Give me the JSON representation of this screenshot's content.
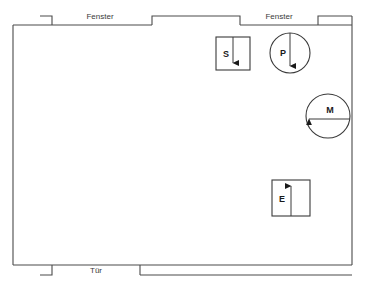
{
  "diagram": {
    "type": "floor-plan",
    "stroke_color": "#4a4a4a",
    "furniture_stroke_color": "#3a3a3a",
    "background_color": "#ffffff",
    "width": 365,
    "height": 289
  },
  "wall_labels": {
    "fenster_left": "Fenster",
    "fenster_right": "Fenster",
    "tuer": "Tür"
  },
  "furniture": [
    {
      "id": "s",
      "letter": "S",
      "shape": "rectangle",
      "arrow_direction": "down",
      "x": 216,
      "y": 37,
      "width": 34,
      "height": 33
    },
    {
      "id": "p",
      "letter": "P",
      "shape": "circle",
      "arrow_direction": "down",
      "cx": 290,
      "cy": 53,
      "r": 20
    },
    {
      "id": "m",
      "letter": "M",
      "shape": "circle",
      "arrow_direction": "left",
      "cx": 328,
      "cy": 116,
      "r": 22
    },
    {
      "id": "e",
      "letter": "E",
      "shape": "rectangle",
      "arrow_direction": "up",
      "x": 272,
      "y": 180,
      "width": 38,
      "height": 36
    }
  ],
  "openings": [
    {
      "name": "window-left",
      "label": "Fenster",
      "wall": "top",
      "x1": 52,
      "x2": 152
    },
    {
      "name": "window-right",
      "label": "Fenster",
      "wall": "top",
      "x1": 240,
      "x2": 318
    },
    {
      "name": "door",
      "label": "Tür",
      "wall": "bottom",
      "x1": 52,
      "x2": 140
    }
  ]
}
